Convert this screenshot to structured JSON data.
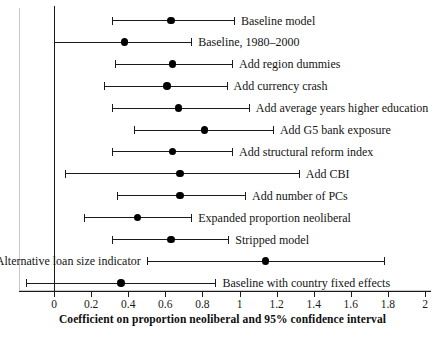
{
  "chart_data": {
    "type": "scatter",
    "subtype": "coefficient-plot-with-error-bars",
    "title": "",
    "xlabel": "Coefficient on proportion neoliberal and 95% confidence interval",
    "ylabel": "",
    "xlim": [
      -0.2,
      2.05
    ],
    "xticks": [
      0,
      0.2,
      0.4,
      0.6,
      0.8,
      1,
      1.2,
      1.4,
      1.6,
      1.8,
      2
    ],
    "xtick_labels": [
      "0",
      "0.2",
      "0.4",
      "0.6",
      "0.8",
      "1",
      "1.2",
      "1.4",
      "1.6",
      "1.8",
      "2"
    ],
    "grid": false,
    "legend": "none",
    "reference_line_x": 0,
    "annotations": [],
    "categories": [
      "Baseline model",
      "Baseline, 1980–2000",
      "Add region dummies",
      "Add currency crash",
      "Add average years higher education",
      "Add G5 bank exposure",
      "Add structural reform index",
      "Add CBI",
      "Add number of PCs",
      "Expanded proportion neoliberal",
      "Stripped model",
      "Alternative loan size indicator",
      "Baseline with country fixed effects"
    ],
    "points": [
      {
        "label": "Baseline model",
        "estimate": 0.63,
        "low": 0.31,
        "high": 0.97,
        "label_side": "right"
      },
      {
        "label": "Baseline, 1980–2000",
        "estimate": 0.38,
        "low": 0.0,
        "high": 0.74,
        "label_side": "right"
      },
      {
        "label": "Add region dummies",
        "estimate": 0.64,
        "low": 0.33,
        "high": 0.96,
        "label_side": "right"
      },
      {
        "label": "Add currency crash",
        "estimate": 0.61,
        "low": 0.27,
        "high": 0.93,
        "label_side": "right"
      },
      {
        "label": "Add average years higher education",
        "estimate": 0.67,
        "low": 0.31,
        "high": 1.05,
        "label_side": "right"
      },
      {
        "label": "Add G5 bank exposure",
        "estimate": 0.81,
        "low": 0.43,
        "high": 1.18,
        "label_side": "right"
      },
      {
        "label": "Add structural reform index",
        "estimate": 0.64,
        "low": 0.31,
        "high": 0.96,
        "label_side": "right"
      },
      {
        "label": "Add CBI",
        "estimate": 0.68,
        "low": 0.06,
        "high": 1.32,
        "label_side": "right"
      },
      {
        "label": "Add number of PCs",
        "estimate": 0.68,
        "low": 0.34,
        "high": 1.03,
        "label_side": "right"
      },
      {
        "label": "Expanded proportion neoliberal",
        "estimate": 0.45,
        "low": 0.16,
        "high": 0.74,
        "label_side": "right"
      },
      {
        "label": "Stripped model",
        "estimate": 0.63,
        "low": 0.31,
        "high": 0.94,
        "label_side": "right"
      },
      {
        "label": "Alternative loan size indicator",
        "estimate": 1.14,
        "low": 0.5,
        "high": 1.78,
        "label_side": "left"
      },
      {
        "label": "Baseline with country fixed effects",
        "estimate": 0.36,
        "low": -0.15,
        "high": 0.87,
        "label_side": "right"
      }
    ],
    "colors": {
      "point": "#000000",
      "whisker": "#1a1a1a",
      "axis": "#1a1a1a",
      "frame": "#c9c9c9",
      "background": "#ffffff"
    }
  }
}
